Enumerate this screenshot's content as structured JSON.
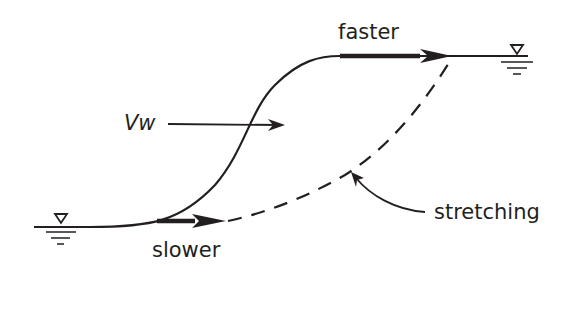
{
  "diagram": {
    "type": "wave-front-steepening",
    "labels": {
      "faster": "faster",
      "slower": "slower",
      "vw": "Vw",
      "stretching": "stretching"
    },
    "symbols": {
      "left_water_level": "water-surface-symbol",
      "right_water_level": "water-surface-symbol"
    },
    "colors": {
      "line": "#231f20",
      "background": "#ffffff"
    }
  }
}
